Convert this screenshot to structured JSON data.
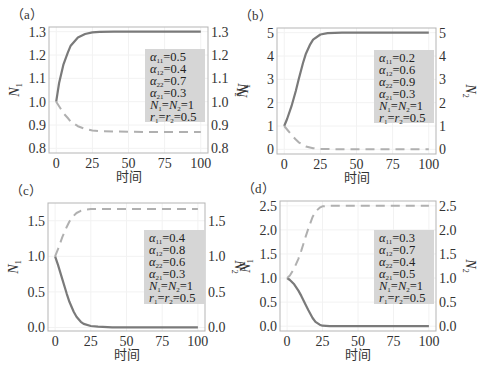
{
  "chart_data": [
    {
      "panel": "(a)",
      "type": "line",
      "xlabel": "时间",
      "ylabel_left": "N1",
      "ylabel_right": "N2",
      "x_ticks": [
        0,
        25,
        50,
        75,
        100
      ],
      "y_ticks": [
        "0.8",
        "0.9",
        "1.0",
        "1.1",
        "1.2",
        "1.3"
      ],
      "ylim": [
        0.78,
        1.32
      ],
      "xlim": [
        -5,
        105
      ],
      "params": {
        "a11": "0.5",
        "a12": "0.4",
        "a22": "0.7",
        "a21": "0.3",
        "N": "N1=N2=1",
        "r": "r1=r2=0.5"
      },
      "series": [
        {
          "name": "N1",
          "style": "solid",
          "x": [
            0,
            2,
            5,
            8,
            10,
            15,
            20,
            25,
            30,
            40,
            50,
            75,
            100
          ],
          "values": [
            1.0,
            1.08,
            1.16,
            1.21,
            1.24,
            1.275,
            1.29,
            1.297,
            1.299,
            1.3,
            1.3,
            1.3,
            1.3
          ]
        },
        {
          "name": "N2",
          "style": "dashed",
          "x": [
            0,
            2,
            5,
            8,
            10,
            15,
            20,
            25,
            30,
            40,
            50,
            75,
            100
          ],
          "values": [
            1.0,
            0.98,
            0.95,
            0.93,
            0.915,
            0.895,
            0.883,
            0.877,
            0.874,
            0.872,
            0.871,
            0.87,
            0.87
          ]
        }
      ]
    },
    {
      "panel": "(b)",
      "type": "line",
      "xlabel": "时间",
      "ylabel_left": "N1",
      "ylabel_right": "N2",
      "x_ticks": [
        0,
        25,
        50,
        75,
        100
      ],
      "y_ticks": [
        "0",
        "1",
        "2",
        "3",
        "4",
        "5"
      ],
      "ylim": [
        -0.2,
        5.2
      ],
      "xlim": [
        -5,
        105
      ],
      "params": {
        "a11": "0.2",
        "a12": "0.6",
        "a22": "0.9",
        "a21": "0.3",
        "N": "N1=N2=1",
        "r": "r1=r2=0.5"
      },
      "series": [
        {
          "name": "N1",
          "style": "solid",
          "x": [
            0,
            2,
            5,
            8,
            10,
            13,
            15,
            18,
            20,
            25,
            30,
            40,
            50,
            75,
            100
          ],
          "values": [
            1.0,
            1.3,
            1.85,
            2.5,
            3.0,
            3.7,
            4.1,
            4.5,
            4.7,
            4.92,
            4.98,
            5.0,
            5.0,
            5.0,
            5.0
          ]
        },
        {
          "name": "N2",
          "style": "dashed",
          "x": [
            0,
            2,
            5,
            8,
            10,
            15,
            20,
            25,
            30,
            50,
            75,
            100
          ],
          "values": [
            1.0,
            0.85,
            0.62,
            0.42,
            0.3,
            0.12,
            0.05,
            0.02,
            0.01,
            0.0,
            0.0,
            0.0
          ]
        }
      ]
    },
    {
      "panel": "(c)",
      "type": "line",
      "xlabel": "时间",
      "ylabel_left": "N1",
      "ylabel_right": "N2",
      "x_ticks": [
        0,
        25,
        50,
        75,
        100
      ],
      "y_ticks": [
        "0.0",
        "0.5",
        "1.0",
        "1.5"
      ],
      "ylim": [
        -0.05,
        1.75
      ],
      "xlim": [
        -5,
        105
      ],
      "params": {
        "a11": "0.4",
        "a12": "0.8",
        "a22": "0.6",
        "a21": "0.3",
        "N": "N1=N2=1",
        "r": "r1=r2=0.5"
      },
      "series": [
        {
          "name": "N1",
          "style": "solid",
          "x": [
            0,
            2,
            5,
            8,
            10,
            13,
            15,
            18,
            20,
            25,
            30,
            40,
            50,
            75,
            100
          ],
          "values": [
            1.0,
            0.88,
            0.68,
            0.48,
            0.36,
            0.22,
            0.15,
            0.08,
            0.05,
            0.02,
            0.01,
            0.0,
            0.0,
            0.0,
            0.0
          ]
        },
        {
          "name": "N2",
          "style": "dashed",
          "x": [
            0,
            2,
            5,
            8,
            10,
            13,
            15,
            18,
            20,
            25,
            30,
            40,
            50,
            75,
            100
          ],
          "values": [
            1.0,
            1.1,
            1.27,
            1.41,
            1.49,
            1.57,
            1.61,
            1.64,
            1.655,
            1.665,
            1.667,
            1.667,
            1.667,
            1.667,
            1.667
          ]
        }
      ]
    },
    {
      "panel": "(d)",
      "type": "line",
      "xlabel": "时间",
      "ylabel_left": "N1",
      "ylabel_right": "N2",
      "x_ticks": [
        0,
        25,
        50,
        75,
        100
      ],
      "y_ticks": [
        "0.0",
        "0.5",
        "1.0",
        "1.5",
        "2.0",
        "2.5"
      ],
      "ylim": [
        -0.1,
        2.6
      ],
      "xlim": [
        -5,
        105
      ],
      "params": {
        "a11": "0.3",
        "a12": "0.7",
        "a22": "0.4",
        "a21": "0.5",
        "N": "N1=N2=1",
        "r": "r1=r2=0.5"
      },
      "series": [
        {
          "name": "N1",
          "style": "solid",
          "x": [
            0,
            2,
            5,
            8,
            10,
            13,
            15,
            18,
            20,
            23,
            25,
            30,
            40,
            50,
            75,
            100
          ],
          "values": [
            1.0,
            0.96,
            0.87,
            0.74,
            0.63,
            0.45,
            0.33,
            0.17,
            0.09,
            0.03,
            0.01,
            0.0,
            0.0,
            0.0,
            0.0,
            0.0
          ]
        },
        {
          "name": "N2",
          "style": "dashed",
          "x": [
            0,
            2,
            5,
            8,
            10,
            13,
            15,
            18,
            20,
            23,
            25,
            30,
            40,
            50,
            75,
            100
          ],
          "values": [
            1.0,
            1.05,
            1.2,
            1.4,
            1.57,
            1.85,
            2.03,
            2.27,
            2.38,
            2.46,
            2.49,
            2.5,
            2.5,
            2.5,
            2.5,
            2.5
          ]
        }
      ]
    }
  ],
  "panels": [
    {
      "label": "（a）",
      "xlabel": "时间",
      "ylabel_left": "N",
      "ylabel_left_sub": "1",
      "ylabel_right": "N",
      "ylabel_right_sub": "2"
    },
    {
      "label": "（b）",
      "xlabel": "时间",
      "ylabel_left": "N",
      "ylabel_left_sub": "1",
      "ylabel_right": "N",
      "ylabel_right_sub": "2"
    },
    {
      "label": "（c）",
      "xlabel": "时间",
      "ylabel_left": "N",
      "ylabel_left_sub": "1",
      "ylabel_right": "N",
      "ylabel_right_sub": "2"
    },
    {
      "label": "（d）",
      "xlabel": "时间",
      "ylabel_left": "N",
      "ylabel_left_sub": "1",
      "ylabel_right": "N",
      "ylabel_right_sub": "2"
    }
  ],
  "colors": {
    "solid": "#7a7a7a",
    "dashed": "#b0b0b0",
    "frame": "#b5b5b5",
    "legend_bg": "#d6d6d6",
    "grid": "#f2f2f2"
  }
}
